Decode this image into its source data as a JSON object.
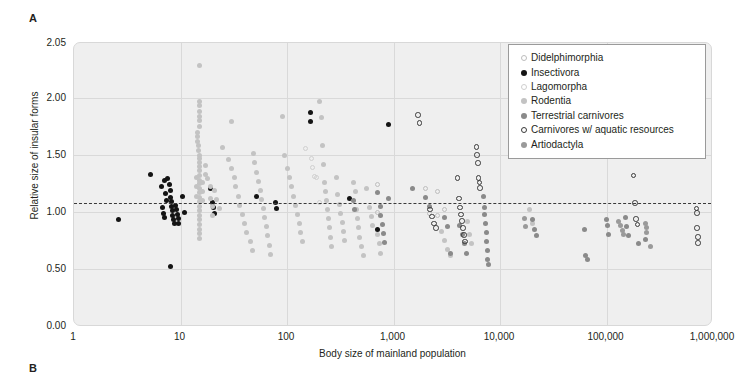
{
  "panels": {
    "a_label": "A",
    "b_label": "B"
  },
  "chart_data": {
    "type": "scatter",
    "title": "",
    "xlabel": "Body size of mainland population",
    "ylabel": "Relative size of insular forms",
    "xscale": "log",
    "xlim": [
      1,
      1000000
    ],
    "ylim": [
      0.0,
      2.05
    ],
    "grid": true,
    "xticks": [
      "1",
      "10",
      "100",
      "1,000",
      "10,000",
      "100,000",
      "1,000,000"
    ],
    "xtick_values": [
      1,
      10,
      100,
      1000,
      10000,
      100000,
      1000000
    ],
    "yticks": [
      "0.00",
      "0.50",
      "1.00",
      "1.50",
      "2.00",
      "2.05"
    ],
    "ytick_values": [
      0.0,
      0.5,
      1.0,
      1.5,
      2.0,
      2.05
    ],
    "reference_line": {
      "value": 1.08,
      "style": "dashed",
      "color": "#3a3a3a",
      "orientation": "horizontal"
    },
    "legend_position": "top-right",
    "colors": {
      "didelphimorphia": "#bdbdbd",
      "insectivora": "#141414",
      "lagomorpha": "#cfcfcf",
      "rodentia": "#c3c3c3",
      "terrestrial_carnivores": "#8a8a8a",
      "carnivores_aquatic": "#3a3a3a",
      "artiodactyla": "#9a9a9a"
    },
    "series": [
      {
        "name": "Didelphimorphia",
        "marker": "open-circle",
        "color": "#bdbdbd",
        "points": [
          [
            700,
            1.24
          ],
          [
            2000,
            1.21
          ],
          [
            2600,
            1.18
          ],
          [
            3000,
            1.02
          ],
          [
            700,
            1.0
          ],
          [
            2200,
            0.99
          ],
          [
            2600,
            0.97
          ]
        ]
      },
      {
        "name": "Insectivora",
        "marker": "filled-circle",
        "color": "#141414",
        "points": [
          [
            2.6,
            0.93
          ],
          [
            5.2,
            1.33
          ],
          [
            6.6,
            1.22
          ],
          [
            7.0,
            1.28
          ],
          [
            7.6,
            1.29
          ],
          [
            7.8,
            1.24
          ],
          [
            8.0,
            1.19
          ],
          [
            8.0,
            1.13
          ],
          [
            8.2,
            1.09
          ],
          [
            8.3,
            1.05
          ],
          [
            8.4,
            1.01
          ],
          [
            8.5,
            0.97
          ],
          [
            8.6,
            0.93
          ],
          [
            8.8,
            0.9
          ],
          [
            9.0,
            1.06
          ],
          [
            9.2,
            1.02
          ],
          [
            9.4,
            0.98
          ],
          [
            9.5,
            0.94
          ],
          [
            9.6,
            0.9
          ],
          [
            7.2,
            1.16
          ],
          [
            7.4,
            1.1
          ],
          [
            6.8,
            1.04
          ],
          [
            6.9,
            0.99
          ],
          [
            7.1,
            0.95
          ],
          [
            10.5,
            1.14
          ],
          [
            11.0,
            1.0
          ],
          [
            8.0,
            0.52
          ],
          [
            19,
            1.21
          ],
          [
            20,
            1.08
          ],
          [
            20.5,
            1.04
          ],
          [
            21,
            0.99
          ],
          [
            52,
            1.14
          ],
          [
            78,
            1.08
          ],
          [
            80,
            1.03
          ],
          [
            390,
            1.12
          ],
          [
            700,
            0.85
          ],
          [
            900,
            1.77
          ],
          [
            165,
            1.87
          ],
          [
            168,
            1.79
          ]
        ]
      },
      {
        "name": "Lagomorpha",
        "marker": "open-circle",
        "color": "#cfcfcf",
        "points": [
          [
            150,
            1.56
          ],
          [
            170,
            1.47
          ],
          [
            175,
            1.39
          ],
          [
            180,
            1.31
          ],
          [
            190,
            1.3
          ],
          [
            200,
            1.08
          ]
        ]
      },
      {
        "name": "Rodentia",
        "marker": "filled-circle",
        "color": "#c3c3c3",
        "points": [
          [
            15,
            2.03
          ],
          [
            15,
            1.97
          ],
          [
            15,
            1.93
          ],
          [
            15,
            1.88
          ],
          [
            15,
            1.84
          ],
          [
            15,
            1.8
          ],
          [
            15,
            1.75
          ],
          [
            14.5,
            1.7
          ],
          [
            14.5,
            1.66
          ],
          [
            14.5,
            1.62
          ],
          [
            14.8,
            1.58
          ],
          [
            14.8,
            1.54
          ],
          [
            15,
            1.5
          ],
          [
            15,
            1.47
          ],
          [
            15,
            1.43
          ],
          [
            15,
            1.4
          ],
          [
            15,
            1.36
          ],
          [
            15,
            1.32
          ],
          [
            15,
            1.28
          ],
          [
            15,
            1.25
          ],
          [
            15,
            1.21
          ],
          [
            15,
            1.17
          ],
          [
            15,
            1.13
          ],
          [
            15,
            1.09
          ],
          [
            15,
            1.05
          ],
          [
            15,
            1.01
          ],
          [
            15,
            0.97
          ],
          [
            15,
            0.93
          ],
          [
            15,
            0.89
          ],
          [
            15,
            0.85
          ],
          [
            15,
            0.81
          ],
          [
            15,
            0.77
          ],
          [
            14,
            1.3
          ],
          [
            14,
            1.22
          ],
          [
            14,
            1.14
          ],
          [
            16,
            1.26
          ],
          [
            16,
            1.18
          ],
          [
            16,
            1.1
          ],
          [
            17,
            1.41
          ],
          [
            17,
            1.33
          ],
          [
            18,
            1.29
          ],
          [
            19,
            1.22
          ],
          [
            19,
            1.12
          ],
          [
            20,
            1.05
          ],
          [
            20,
            0.97
          ],
          [
            21,
            1.19
          ],
          [
            22,
            1.11
          ],
          [
            23,
            1.03
          ],
          [
            16,
            2.3
          ],
          [
            25,
            1.57
          ],
          [
            28,
            1.46
          ],
          [
            30,
            1.38
          ],
          [
            32,
            1.3
          ],
          [
            33,
            1.22
          ],
          [
            35,
            1.14
          ],
          [
            36,
            1.06
          ],
          [
            38,
            0.98
          ],
          [
            40,
            0.9
          ],
          [
            42,
            0.82
          ],
          [
            45,
            0.74
          ],
          [
            47,
            0.66
          ],
          [
            30,
            1.79
          ],
          [
            48,
            1.51
          ],
          [
            50,
            1.43
          ],
          [
            52,
            1.35
          ],
          [
            54,
            1.27
          ],
          [
            56,
            1.19
          ],
          [
            58,
            1.11
          ],
          [
            60,
            1.03
          ],
          [
            62,
            0.95
          ],
          [
            64,
            0.87
          ],
          [
            66,
            0.79
          ],
          [
            68,
            0.71
          ],
          [
            70,
            0.63
          ],
          [
            90,
            1.84
          ],
          [
            95,
            1.5
          ],
          [
            100,
            1.38
          ],
          [
            105,
            1.3
          ],
          [
            110,
            1.22
          ],
          [
            115,
            1.14
          ],
          [
            120,
            1.06
          ],
          [
            125,
            0.98
          ],
          [
            130,
            0.9
          ],
          [
            135,
            0.82
          ],
          [
            140,
            0.74
          ],
          [
            200,
            1.97
          ],
          [
            210,
            1.83
          ],
          [
            215,
            1.58
          ],
          [
            220,
            1.42
          ],
          [
            225,
            1.26
          ],
          [
            230,
            1.18
          ],
          [
            235,
            1.1
          ],
          [
            240,
            1.02
          ],
          [
            245,
            0.94
          ],
          [
            250,
            0.86
          ],
          [
            255,
            0.78
          ],
          [
            260,
            0.7
          ],
          [
            290,
            1.3
          ],
          [
            300,
            1.15
          ],
          [
            310,
            1.07
          ],
          [
            320,
            0.99
          ],
          [
            330,
            0.91
          ],
          [
            340,
            0.83
          ],
          [
            350,
            0.75
          ],
          [
            420,
            1.26
          ],
          [
            440,
            1.18
          ],
          [
            450,
            1.02
          ],
          [
            460,
            0.94
          ],
          [
            470,
            0.86
          ],
          [
            480,
            0.78
          ],
          [
            500,
            0.7
          ],
          [
            520,
            0.62
          ],
          [
            560,
            1.21
          ],
          [
            600,
            1.04
          ],
          [
            620,
            0.96
          ],
          [
            640,
            0.88
          ],
          [
            700,
            0.8
          ],
          [
            740,
            0.72
          ],
          [
            760,
            0.64
          ],
          [
            2800,
            0.83
          ],
          [
            3000,
            0.75
          ],
          [
            3200,
            0.67
          ],
          [
            3400,
            0.62
          ],
          [
            5000,
            0.92
          ],
          [
            5200,
            0.8
          ],
          [
            5400,
            0.72
          ],
          [
            19000,
            1.02
          ],
          [
            20000,
            0.9
          ]
        ]
      },
      {
        "name": "Terrestrial carnivores",
        "marker": "filled-circle",
        "color": "#8a8a8a",
        "points": [
          [
            420,
            1.1
          ],
          [
            430,
            1.02
          ],
          [
            700,
            1.17
          ],
          [
            750,
            1.05
          ],
          [
            760,
            0.97
          ],
          [
            780,
            0.89
          ],
          [
            800,
            0.81
          ],
          [
            820,
            0.73
          ],
          [
            900,
            1.12
          ],
          [
            1500,
            1.21
          ],
          [
            2000,
            1.13
          ],
          [
            2200,
            1.05
          ],
          [
            3000,
            0.95
          ],
          [
            3200,
            0.87
          ],
          [
            3400,
            0.64
          ],
          [
            4200,
            0.88
          ],
          [
            4400,
            0.8
          ],
          [
            4600,
            0.72
          ],
          [
            4800,
            0.64
          ],
          [
            7000,
            1.14
          ],
          [
            7100,
            1.04
          ],
          [
            7200,
            0.98
          ],
          [
            7300,
            0.9
          ],
          [
            7400,
            0.82
          ],
          [
            7500,
            0.74
          ],
          [
            7600,
            0.66
          ],
          [
            7700,
            0.58
          ],
          [
            7800,
            0.54
          ],
          [
            20000,
            0.93
          ],
          [
            21000,
            0.85
          ],
          [
            22000,
            0.79
          ],
          [
            62000,
            0.85
          ],
          [
            64000,
            0.62
          ],
          [
            66000,
            0.58
          ],
          [
            100000,
            0.93
          ],
          [
            102000,
            0.88
          ],
          [
            104000,
            0.8
          ],
          [
            150000,
            0.95
          ],
          [
            155000,
            0.87
          ],
          [
            160000,
            0.79
          ],
          [
            200000,
            0.72
          ],
          [
            230000,
            0.76
          ]
        ]
      },
      {
        "name": "Carnivores w/ aquatic resources",
        "marker": "open-circle",
        "color": "#3a3a3a",
        "points": [
          [
            1700,
            1.85
          ],
          [
            1750,
            1.78
          ],
          [
            6000,
            1.57
          ],
          [
            6100,
            1.5
          ],
          [
            6200,
            1.43
          ],
          [
            6300,
            1.3
          ],
          [
            6400,
            1.26
          ],
          [
            6500,
            1.21
          ],
          [
            4000,
            1.3
          ],
          [
            4100,
            1.12
          ],
          [
            4200,
            1.04
          ],
          [
            4300,
            0.98
          ],
          [
            4400,
            0.92
          ],
          [
            4500,
            0.86
          ],
          [
            4600,
            0.8
          ],
          [
            4700,
            0.74
          ],
          [
            2200,
            1.02
          ],
          [
            2300,
            0.96
          ],
          [
            2400,
            0.9
          ],
          [
            2500,
            0.86
          ],
          [
            180000,
            1.32
          ],
          [
            185000,
            1.08
          ],
          [
            190000,
            0.94
          ],
          [
            195000,
            0.89
          ],
          [
            700000,
            1.03
          ],
          [
            705000,
            0.99
          ],
          [
            710000,
            0.86
          ],
          [
            720000,
            0.78
          ],
          [
            725000,
            0.73
          ]
        ]
      },
      {
        "name": "Artiodactyla",
        "marker": "filled-circle",
        "color": "#9a9a9a",
        "points": [
          [
            17000,
            0.94
          ],
          [
            17500,
            0.87
          ],
          [
            130000,
            0.92
          ],
          [
            135000,
            0.88
          ],
          [
            140000,
            0.84
          ],
          [
            145000,
            0.8
          ],
          [
            230000,
            0.9
          ],
          [
            235000,
            0.86
          ],
          [
            240000,
            0.82
          ],
          [
            260000,
            0.7
          ]
        ]
      }
    ]
  },
  "legend": {
    "items": [
      {
        "label": "Didelphimorphia",
        "marker": "open-circle",
        "color": "#bdbdbd",
        "style": "pt-open-light"
      },
      {
        "label": "Insectivora",
        "marker": "filled-circle",
        "color": "#141414",
        "style": "pt-fill-black"
      },
      {
        "label": "Lagomorpha",
        "marker": "open-circle",
        "color": "#cfcfcf",
        "style": "pt-open-vlight"
      },
      {
        "label": "Rodentia",
        "marker": "filled-circle",
        "color": "#c3c3c3",
        "style": "pt-fill-light"
      },
      {
        "label": "Terrestrial carnivores",
        "marker": "filled-circle",
        "color": "#8a8a8a",
        "style": "pt-fill-mid"
      },
      {
        "label": "Carnivores w/ aquatic resources",
        "marker": "open-circle",
        "color": "#3a3a3a",
        "style": "pt-open-dark"
      },
      {
        "label": "Artiodactyla",
        "marker": "filled-circle",
        "color": "#9a9a9a",
        "style": "pt-fill-art"
      }
    ]
  }
}
